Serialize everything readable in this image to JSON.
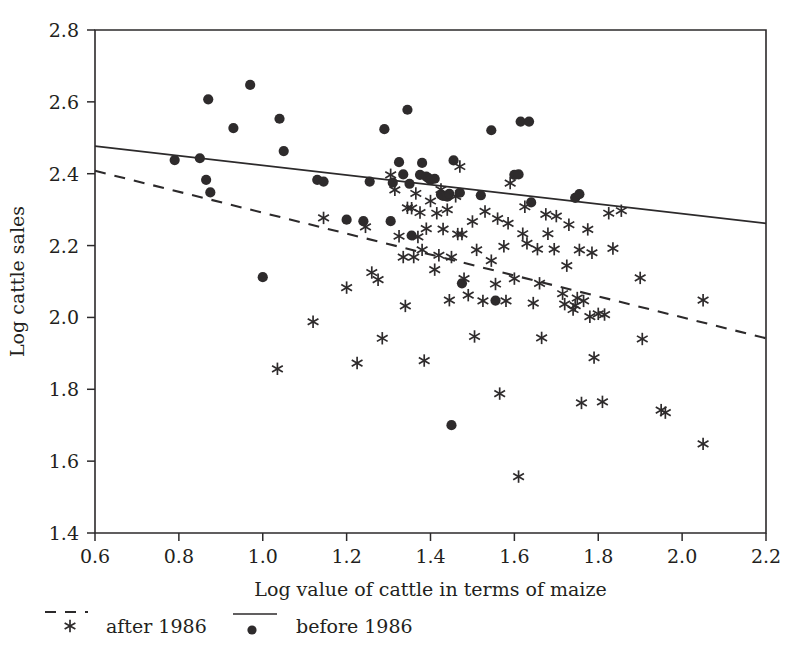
{
  "chart_data": {
    "type": "scatter",
    "title": "",
    "xlabel": "Log value of cattle in terms of maize",
    "ylabel": "Log cattle sales",
    "xlim": [
      0.6,
      2.2
    ],
    "ylim": [
      1.4,
      2.8
    ],
    "xticks": [
      "0.6",
      "0.8",
      "1.0",
      "1.2",
      "1.4",
      "1.6",
      "1.8",
      "2.0",
      "2.2"
    ],
    "xtick_values": [
      0.6,
      0.8,
      1.0,
      1.2,
      1.4,
      1.6,
      1.8,
      2.0,
      2.2
    ],
    "yticks": [
      "1.4",
      "1.6",
      "1.8",
      "2.0",
      "2.2",
      "2.4",
      "2.6",
      "2.8"
    ],
    "ytick_values": [
      1.4,
      1.6,
      1.8,
      2.0,
      2.2,
      2.4,
      2.6,
      2.8
    ],
    "grid": false,
    "legend_position": "below-axes",
    "series": [
      {
        "name": "before 1986",
        "marker": "dot",
        "line_style": "solid",
        "color": "#2e2b2c",
        "trend_line": {
          "x": [
            0.6,
            2.2
          ],
          "y": [
            2.477,
            2.262
          ]
        },
        "points": [
          [
            0.79,
            2.438
          ],
          [
            0.85,
            2.443
          ],
          [
            0.87,
            2.607
          ],
          [
            0.865,
            2.383
          ],
          [
            0.875,
            2.348
          ],
          [
            0.93,
            2.527
          ],
          [
            0.97,
            2.647
          ],
          [
            1.0,
            2.112
          ],
          [
            1.04,
            2.553
          ],
          [
            1.05,
            2.463
          ],
          [
            1.13,
            2.383
          ],
          [
            1.145,
            2.378
          ],
          [
            1.2,
            2.272
          ],
          [
            1.24,
            2.268
          ],
          [
            1.255,
            2.378
          ],
          [
            1.29,
            2.524
          ],
          [
            1.305,
            2.268
          ],
          [
            1.31,
            2.375
          ],
          [
            1.325,
            2.432
          ],
          [
            1.335,
            2.398
          ],
          [
            1.345,
            2.578
          ],
          [
            1.35,
            2.372
          ],
          [
            1.355,
            2.228
          ],
          [
            1.375,
            2.397
          ],
          [
            1.38,
            2.43
          ],
          [
            1.39,
            2.392
          ],
          [
            1.395,
            2.388
          ],
          [
            1.4,
            2.383
          ],
          [
            1.41,
            2.386
          ],
          [
            1.425,
            2.342
          ],
          [
            1.43,
            2.338
          ],
          [
            1.44,
            2.336
          ],
          [
            1.445,
            2.344
          ],
          [
            1.45,
            1.7
          ],
          [
            1.455,
            2.437
          ],
          [
            1.47,
            2.347
          ],
          [
            1.475,
            2.095
          ],
          [
            1.52,
            2.34
          ],
          [
            1.545,
            2.521
          ],
          [
            1.555,
            2.047
          ],
          [
            1.6,
            2.397
          ],
          [
            1.61,
            2.398
          ],
          [
            1.615,
            2.545
          ],
          [
            1.635,
            2.545
          ],
          [
            1.64,
            2.32
          ],
          [
            1.745,
            2.333
          ],
          [
            1.755,
            2.343
          ]
        ]
      },
      {
        "name": "after 1986",
        "marker": "asterisk",
        "line_style": "dashed",
        "color": "#2e2b2c",
        "trend_line": {
          "x": [
            0.6,
            2.2
          ],
          "y": [
            2.408,
            1.942
          ]
        },
        "points": [
          [
            1.035,
            1.857
          ],
          [
            1.12,
            1.988
          ],
          [
            1.145,
            2.277
          ],
          [
            1.2,
            2.083
          ],
          [
            1.225,
            1.873
          ],
          [
            1.245,
            2.252
          ],
          [
            1.26,
            2.125
          ],
          [
            1.275,
            2.105
          ],
          [
            1.285,
            1.942
          ],
          [
            1.305,
            2.397
          ],
          [
            1.315,
            2.355
          ],
          [
            1.325,
            2.226
          ],
          [
            1.335,
            2.168
          ],
          [
            1.34,
            2.032
          ],
          [
            1.345,
            2.305
          ],
          [
            1.355,
            2.304
          ],
          [
            1.36,
            2.168
          ],
          [
            1.365,
            2.345
          ],
          [
            1.37,
            2.224
          ],
          [
            1.375,
            2.292
          ],
          [
            1.38,
            2.188
          ],
          [
            1.385,
            1.88
          ],
          [
            1.39,
            2.247
          ],
          [
            1.4,
            2.324
          ],
          [
            1.41,
            2.133
          ],
          [
            1.415,
            2.29
          ],
          [
            1.42,
            2.173
          ],
          [
            1.425,
            2.356
          ],
          [
            1.43,
            2.246
          ],
          [
            1.44,
            2.3
          ],
          [
            1.445,
            2.048
          ],
          [
            1.45,
            2.168
          ],
          [
            1.46,
            2.337
          ],
          [
            1.465,
            2.232
          ],
          [
            1.47,
            2.42
          ],
          [
            1.475,
            2.232
          ],
          [
            1.48,
            2.108
          ],
          [
            1.49,
            2.062
          ],
          [
            1.5,
            2.267
          ],
          [
            1.505,
            1.947
          ],
          [
            1.51,
            2.188
          ],
          [
            1.525,
            2.046
          ],
          [
            1.53,
            2.295
          ],
          [
            1.545,
            2.158
          ],
          [
            1.555,
            2.093
          ],
          [
            1.56,
            2.275
          ],
          [
            1.565,
            1.788
          ],
          [
            1.575,
            2.198
          ],
          [
            1.58,
            2.046
          ],
          [
            1.585,
            2.262
          ],
          [
            1.59,
            2.374
          ],
          [
            1.6,
            2.108
          ],
          [
            1.61,
            1.557
          ],
          [
            1.62,
            2.233
          ],
          [
            1.625,
            2.308
          ],
          [
            1.63,
            2.206
          ],
          [
            1.645,
            2.04
          ],
          [
            1.655,
            2.19
          ],
          [
            1.66,
            2.095
          ],
          [
            1.665,
            1.943
          ],
          [
            1.675,
            2.287
          ],
          [
            1.68,
            2.233
          ],
          [
            1.695,
            2.19
          ],
          [
            1.7,
            2.282
          ],
          [
            1.715,
            2.066
          ],
          [
            1.72,
            2.037
          ],
          [
            1.725,
            2.144
          ],
          [
            1.73,
            2.258
          ],
          [
            1.74,
            2.022
          ],
          [
            1.745,
            2.033
          ],
          [
            1.75,
            2.054
          ],
          [
            1.755,
            2.188
          ],
          [
            1.76,
            1.762
          ],
          [
            1.765,
            2.046
          ],
          [
            1.775,
            2.245
          ],
          [
            1.78,
            2.002
          ],
          [
            1.785,
            2.18
          ],
          [
            1.79,
            1.888
          ],
          [
            1.8,
            2.01
          ],
          [
            1.81,
            1.765
          ],
          [
            1.815,
            2.008
          ],
          [
            1.825,
            2.29
          ],
          [
            1.835,
            2.192
          ],
          [
            1.855,
            2.297
          ],
          [
            1.9,
            2.11
          ],
          [
            1.905,
            1.94
          ],
          [
            1.95,
            1.742
          ],
          [
            1.96,
            1.735
          ],
          [
            2.05,
            2.048
          ],
          [
            2.05,
            1.648
          ]
        ]
      }
    ]
  },
  "legend": {
    "entries": [
      {
        "label": "after 1986",
        "marker": "asterisk",
        "line_style": "dashed"
      },
      {
        "label": "before 1986",
        "marker": "dot",
        "line_style": "solid"
      }
    ]
  },
  "colors": {
    "ink": "#231f20",
    "marker": "#2e2b2c",
    "background": "#ffffff"
  }
}
